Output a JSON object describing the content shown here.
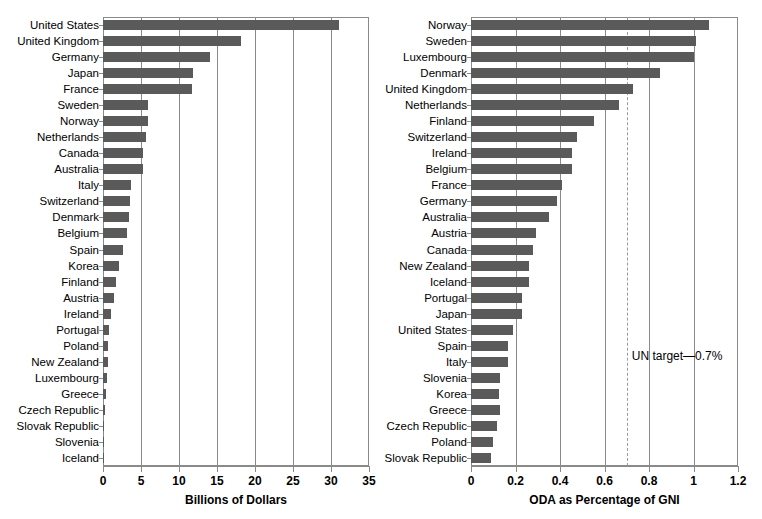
{
  "chart_data": [
    {
      "type": "bar",
      "orientation": "horizontal",
      "panel": "left",
      "title": "",
      "xlabel": "Billions of Dollars",
      "ylabel": "",
      "xlim": [
        0,
        35
      ],
      "xticks": [
        "0",
        "5",
        "10",
        "15",
        "20",
        "25",
        "30",
        "35"
      ],
      "xtick_values": [
        0,
        5,
        10,
        15,
        20,
        25,
        30,
        35
      ],
      "grid": "vertical",
      "bar_color": "#5a5a5a",
      "categories": [
        "United States",
        "United Kingdom",
        "Germany",
        "Japan",
        "France",
        "Sweden",
        "Norway",
        "Netherlands",
        "Canada",
        "Australia",
        "Italy",
        "Switzerland",
        "Denmark",
        "Belgium",
        "Spain",
        "Korea",
        "Finland",
        "Austria",
        "Ireland",
        "Portugal",
        "Poland",
        "New Zealand",
        "Luxembourg",
        "Greece",
        "Czech Republic",
        "Slovak Republic",
        "Slovenia",
        "Iceland"
      ],
      "values": [
        31.1,
        18.1,
        14.1,
        11.9,
        11.7,
        5.9,
        5.9,
        5.6,
        5.2,
        5.2,
        3.7,
        3.5,
        3.4,
        3.1,
        2.6,
        2.1,
        1.75,
        1.5,
        1.05,
        0.75,
        0.65,
        0.6,
        0.55,
        0.35,
        0.25,
        0.1,
        0.08,
        0.05
      ]
    },
    {
      "type": "bar",
      "orientation": "horizontal",
      "panel": "right",
      "title": "",
      "xlabel": "ODA as Percentage of GNI",
      "ylabel": "",
      "xlim": [
        0,
        1.2
      ],
      "xticks": [
        "0",
        "0.2",
        "0.4",
        "0.6",
        "0.8",
        "1",
        "1.2"
      ],
      "xtick_values": [
        0,
        0.2,
        0.4,
        0.6,
        0.8,
        1,
        1.2
      ],
      "grid": "vertical",
      "bar_color": "#5a5a5a",
      "reference_line": {
        "value": 0.7,
        "label": "UN target—0.7%",
        "style": "dashed"
      },
      "categories": [
        "Norway",
        "Sweden",
        "Luxembourg",
        "Denmark",
        "United Kingdom",
        "Netherlands",
        "Finland",
        "Switzerland",
        "Ireland",
        "Belgium",
        "France",
        "Germany",
        "Australia",
        "Austria",
        "Canada",
        "New Zealand",
        "Iceland",
        "Portugal",
        "Japan",
        "United States",
        "Spain",
        "Italy",
        "Slovenia",
        "Korea",
        "Greece",
        "Czech Republic",
        "Poland",
        "Slovak Republic"
      ],
      "values": [
        1.07,
        1.01,
        1.0,
        0.85,
        0.73,
        0.665,
        0.555,
        0.475,
        0.455,
        0.455,
        0.41,
        0.388,
        0.35,
        0.29,
        0.28,
        0.26,
        0.26,
        0.228,
        0.23,
        0.19,
        0.165,
        0.167,
        0.13,
        0.127,
        0.13,
        0.115,
        0.1,
        0.09
      ]
    }
  ]
}
